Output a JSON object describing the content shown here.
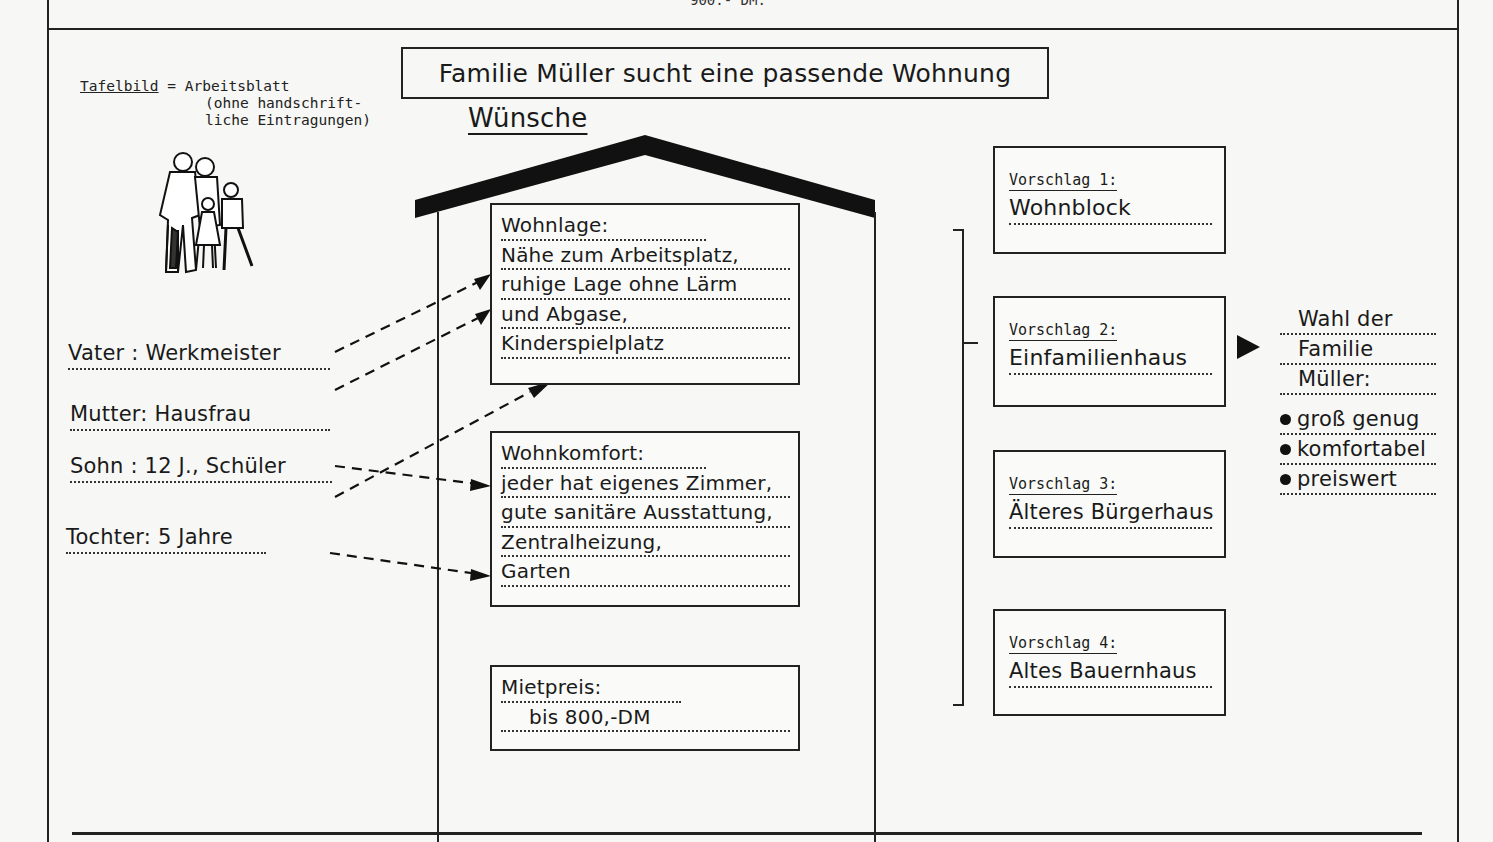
{
  "page_fragment_top": "900.- DM.",
  "legend": {
    "term": "Tafelbild",
    "equals": " = Arbeitsblatt",
    "note_line1": "(ohne handschrift-",
    "note_line2": "liche Eintragungen)"
  },
  "title": "Familie Müller sucht eine passende Wohnung",
  "wishes_heading": "Wünsche",
  "family": [
    {
      "label": "Vater : Werkmeister"
    },
    {
      "label": "Mutter: Hausfrau"
    },
    {
      "label": "Sohn : 12 J., Schüler"
    },
    {
      "label": "Tochter: 5 Jahre"
    }
  ],
  "wishes": {
    "location": {
      "title": "Wohnlage:",
      "items": [
        "Nähe zum Arbeitsplatz,",
        "ruhige Lage ohne Lärm",
        "und Abgase,",
        "Kinderspielplatz"
      ]
    },
    "comfort": {
      "title": "Wohnkomfort:",
      "items": [
        "jeder hat eigenes Zimmer,",
        "gute sanitäre Ausstattung,",
        "Zentralheizung,",
        "Garten"
      ]
    },
    "rent": {
      "title": "Mietpreis:",
      "items": [
        "bis 800,-DM"
      ]
    }
  },
  "proposals": [
    {
      "label": "Vorschlag 1:",
      "value": "Wohnblock"
    },
    {
      "label": "Vorschlag 2:",
      "value": "Einfamilienhaus"
    },
    {
      "label": "Vorschlag 3:",
      "value": "Älteres Bürgerhaus"
    },
    {
      "label": "Vorschlag 4:",
      "value": "Altes Bauernhaus"
    }
  ],
  "choice": {
    "heading_lines": [
      "Wahl der",
      "Familie",
      "Müller:"
    ],
    "reasons": [
      "groß genug",
      "komfortabel",
      "preiswert"
    ]
  },
  "icons": {
    "family_illustration": "family-illustration-icon",
    "choice_arrow": "triangle-right-icon",
    "bullet": "bullet-dot-icon"
  },
  "colors": {
    "ink": "#1a1a1a",
    "paper": "#f7f7f5"
  }
}
